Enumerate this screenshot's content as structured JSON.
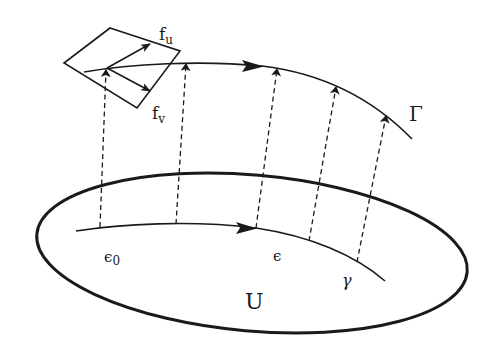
{
  "diagram": {
    "colors": {
      "ink": "#1a1a1a",
      "background": "#ffffff"
    },
    "labels": {
      "f_u": {
        "base": "f",
        "sub": "u"
      },
      "f_v": {
        "base": "f",
        "sub": "v"
      },
      "Gamma": "Γ",
      "epsilon_0": {
        "base": "ϵ",
        "sub": "0"
      },
      "epsilon": "ϵ",
      "gamma": "γ",
      "U": "U"
    },
    "elements": {
      "domain_region": "ellipse U",
      "lower_curve": "γ with arrow",
      "upper_curve": "Γ with arrow",
      "frame_plane": "parallelogram tangent plane at start of Γ",
      "frame_vectors": [
        "f_u",
        "f_v"
      ],
      "lift_arrows_count": 5
    }
  }
}
